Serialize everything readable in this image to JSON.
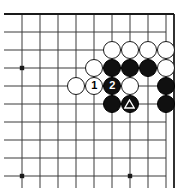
{
  "figure": {
    "kind": "go-board-diagram",
    "background_color": "#ffffff",
    "line_color": "#3a3a3a",
    "edge_color": "#1a1a1a",
    "black_stone_color": "#101010",
    "white_stone_color": "#ffffff",
    "marker_color": "#ffffff"
  },
  "board": {
    "cell_size": 18,
    "origin_x": 22,
    "origin_y": 14,
    "cols": 9,
    "rows": 10,
    "stone_radius": 9.2,
    "right_edge_x": 174,
    "star_points": [
      {
        "col": 0,
        "row": 3
      },
      {
        "col": 0,
        "row": 9
      },
      {
        "col": 6,
        "row": 9
      }
    ]
  },
  "stones": [
    {
      "col": 5,
      "row": 2,
      "color": "white",
      "label": "",
      "marker": ""
    },
    {
      "col": 6,
      "row": 2,
      "color": "white",
      "label": "",
      "marker": ""
    },
    {
      "col": 7,
      "row": 2,
      "color": "white",
      "label": "",
      "marker": ""
    },
    {
      "col": 8,
      "row": 2,
      "color": "white",
      "label": "",
      "marker": ""
    },
    {
      "col": 4,
      "row": 3,
      "color": "white",
      "label": "",
      "marker": ""
    },
    {
      "col": 5,
      "row": 3,
      "color": "black",
      "label": "",
      "marker": ""
    },
    {
      "col": 6,
      "row": 3,
      "color": "black",
      "label": "",
      "marker": ""
    },
    {
      "col": 7,
      "row": 3,
      "color": "black",
      "label": "",
      "marker": ""
    },
    {
      "col": 8,
      "row": 3,
      "color": "white",
      "label": "",
      "marker": ""
    },
    {
      "col": 3,
      "row": 4,
      "color": "white",
      "label": "",
      "marker": ""
    },
    {
      "col": 4,
      "row": 4,
      "color": "white",
      "label": "1",
      "marker": ""
    },
    {
      "col": 5,
      "row": 4,
      "color": "black",
      "label": "2",
      "marker": ""
    },
    {
      "col": 6,
      "row": 4,
      "color": "white",
      "label": "",
      "marker": ""
    },
    {
      "col": 8,
      "row": 4,
      "color": "black",
      "label": "",
      "marker": ""
    },
    {
      "col": 5,
      "row": 5,
      "color": "black",
      "label": "",
      "marker": ""
    },
    {
      "col": 6,
      "row": 5,
      "color": "black",
      "label": "",
      "marker": "triangle"
    },
    {
      "col": 8,
      "row": 5,
      "color": "black",
      "label": "",
      "marker": ""
    }
  ],
  "move_labels": {
    "move_1": "1",
    "move_2": "2"
  },
  "markers": {
    "triangle_glyph": "triangle"
  }
}
